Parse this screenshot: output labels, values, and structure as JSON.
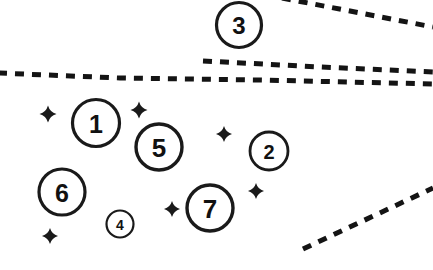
{
  "canvas": {
    "width": 433,
    "height": 270,
    "background_color": "#ffffff",
    "ink_color": "#1a1a1a"
  },
  "markers": [
    {
      "label": "1",
      "cx": 96,
      "cy": 123,
      "r": 23.5,
      "stroke_width": 3.2,
      "font_size": 25
    },
    {
      "label": "2",
      "cx": 269,
      "cy": 151,
      "r": 19.0,
      "stroke_width": 2.8,
      "font_size": 20
    },
    {
      "label": "3",
      "cx": 239,
      "cy": 25,
      "r": 22.5,
      "stroke_width": 3.2,
      "font_size": 24
    },
    {
      "label": "4",
      "cx": 120,
      "cy": 224,
      "r": 13.5,
      "stroke_width": 2.2,
      "font_size": 14
    },
    {
      "label": "5",
      "cx": 159,
      "cy": 147,
      "r": 23.0,
      "stroke_width": 3.4,
      "font_size": 26
    },
    {
      "label": "6",
      "cx": 62,
      "cy": 192,
      "r": 23.0,
      "stroke_width": 3.2,
      "font_size": 25
    },
    {
      "label": "7",
      "cx": 210,
      "cy": 208,
      "r": 23.0,
      "stroke_width": 3.4,
      "font_size": 26
    }
  ],
  "sparkles": [
    {
      "cx": 48,
      "cy": 114,
      "size": 8.5
    },
    {
      "cx": 139,
      "cy": 110,
      "size": 8.5
    },
    {
      "cx": 224,
      "cy": 134,
      "size": 8.0
    },
    {
      "cx": 256,
      "cy": 191,
      "size": 8.0
    },
    {
      "cx": 172,
      "cy": 209,
      "size": 8.0
    },
    {
      "cx": 50,
      "cy": 236,
      "size": 8.0
    }
  ],
  "boundary_lines": [
    {
      "name": "top-right-diagonal-boundary",
      "path": "M 282 -2 L 433 27",
      "stroke_width": 5,
      "dash": "9 8"
    },
    {
      "name": "upper-horizontal-boundary",
      "path": "M 203 61 L 320 67 L 433 72",
      "stroke_width": 5,
      "dash": "9 8"
    },
    {
      "name": "main-horizontal-boundary",
      "path": "M -2 73 L 120 78 L 260 80 L 433 84",
      "stroke_width": 5,
      "dash": "9 8"
    },
    {
      "name": "bottom-right-diagonal-boundary",
      "path": "M 303 249 L 433 188",
      "stroke_width": 5,
      "dash": "9 8"
    }
  ]
}
